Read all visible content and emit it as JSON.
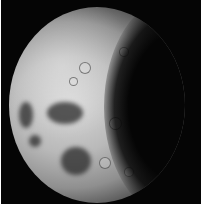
{
  "image": {
    "subject": "Moon",
    "description": "Gibbous Moon, lit from the left with the terminator on the right, with dark maria patches on the lower left and a heavily cratered surface",
    "background_color": "#050505",
    "border_color": "#ffffff",
    "maria": [
      {
        "x": 10,
        "y": 95,
        "w": 14,
        "h": 26
      },
      {
        "x": 38,
        "y": 95,
        "w": 36,
        "h": 22
      },
      {
        "x": 52,
        "y": 140,
        "w": 30,
        "h": 28
      },
      {
        "x": 20,
        "y": 128,
        "w": 12,
        "h": 12
      }
    ],
    "craters": [
      {
        "x": 70,
        "y": 55,
        "s": 10
      },
      {
        "x": 110,
        "y": 40,
        "s": 8
      },
      {
        "x": 118,
        "y": 85,
        "s": 12
      },
      {
        "x": 140,
        "y": 70,
        "s": 9
      },
      {
        "x": 100,
        "y": 110,
        "s": 11
      },
      {
        "x": 130,
        "y": 125,
        "s": 8
      },
      {
        "x": 90,
        "y": 150,
        "s": 10
      },
      {
        "x": 60,
        "y": 70,
        "s": 7
      },
      {
        "x": 145,
        "y": 100,
        "s": 9
      },
      {
        "x": 115,
        "y": 160,
        "s": 8
      }
    ]
  }
}
